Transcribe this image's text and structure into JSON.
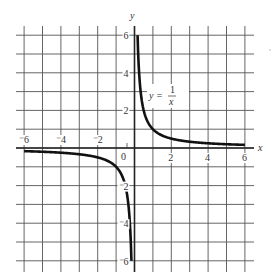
{
  "chart_data": {
    "type": "line",
    "title": "",
    "function_label": "y = 1/x",
    "function_label_parts": {
      "lhs": "y =",
      "numerator": "1",
      "denominator": "x"
    },
    "xlabel": "x",
    "ylabel": "y",
    "xlim": [
      -6,
      6
    ],
    "ylim": [
      -6,
      6
    ],
    "grid": true,
    "grid_step": 1,
    "x_ticks": [
      {
        "value": -6,
        "label": "⁻6"
      },
      {
        "value": -4,
        "label": "⁻4"
      },
      {
        "value": -2,
        "label": "⁻2"
      },
      {
        "value": 0,
        "label": "0"
      },
      {
        "value": 2,
        "label": "2"
      },
      {
        "value": 4,
        "label": "4"
      },
      {
        "value": 6,
        "label": "6"
      }
    ],
    "y_ticks": [
      {
        "value": 6,
        "label": "6"
      },
      {
        "value": 4,
        "label": "4"
      },
      {
        "value": 2,
        "label": "2"
      },
      {
        "value": -2,
        "label": "⁻2"
      },
      {
        "value": -4,
        "label": "⁻4"
      },
      {
        "value": -6,
        "label": "⁻6"
      }
    ],
    "series": [
      {
        "name": "y = 1/x (x > 0)",
        "x": [
          0.1667,
          0.2,
          0.25,
          0.333,
          0.5,
          0.75,
          1,
          1.5,
          2,
          3,
          4,
          5,
          6
        ],
        "y": [
          6,
          5,
          4,
          3,
          2,
          1.333,
          1,
          0.667,
          0.5,
          0.333,
          0.25,
          0.2,
          0.1667
        ]
      },
      {
        "name": "y = 1/x (x < 0)",
        "x": [
          -6,
          -5,
          -4,
          -3,
          -2,
          -1.5,
          -1,
          -0.75,
          -0.5,
          -0.333,
          -0.25,
          -0.2,
          -0.1667
        ],
        "y": [
          -0.1667,
          -0.2,
          -0.25,
          -0.333,
          -0.5,
          -0.667,
          -1,
          -1.333,
          -2,
          -3,
          -4,
          -5,
          -6
        ]
      }
    ],
    "colors": {
      "curve": "#111111",
      "grid": "#555555",
      "axis": "#222222",
      "background": "#ffffff"
    }
  }
}
